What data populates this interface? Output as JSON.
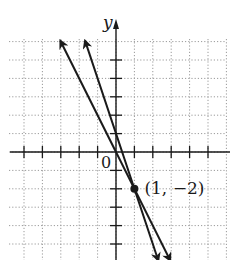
{
  "chart_data": {
    "type": "line",
    "title": "",
    "xlabel": "",
    "ylabel": "y",
    "origin_label": "0",
    "xlim": [
      -6.3,
      6.0
    ],
    "ylim": [
      -5.9,
      6.2
    ],
    "grid": true,
    "grid_style": "dotted",
    "tick_spacing": 1,
    "x_ticks": [
      -5,
      -4,
      -3,
      -2,
      -1,
      1,
      2,
      3,
      4,
      5
    ],
    "y_ticks": [
      -5,
      -4,
      -3,
      -2,
      -1,
      1,
      2,
      3,
      4,
      5
    ],
    "series": [
      {
        "name": "line-a",
        "equation": "y = -2x",
        "slope": -2,
        "intercept": 0,
        "arrows": "both"
      },
      {
        "name": "line-b",
        "equation": "y = -3x + 1",
        "slope": -3,
        "intercept": 1,
        "arrows": "both"
      }
    ],
    "annotations": [
      {
        "type": "point",
        "x": 1,
        "y": -2,
        "label": "(1, −2)"
      }
    ]
  },
  "colors": {
    "line": "#1a1a1a",
    "grid": "#9a9a9a",
    "background": "#ffffff"
  }
}
